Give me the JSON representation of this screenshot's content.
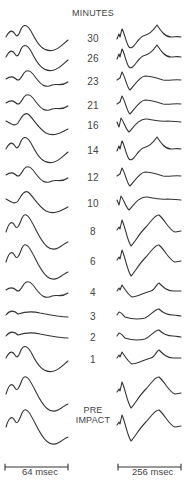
{
  "figure": {
    "header": "MINUTES",
    "pre_impact_label": [
      "PRE",
      "IMPACT"
    ],
    "rows": [
      {
        "label": "30",
        "y": 37,
        "left": "A",
        "right": "A"
      },
      {
        "label": "26",
        "y": 57,
        "left": "A",
        "right": "A"
      },
      {
        "label": "23",
        "y": 80,
        "left": "B",
        "right": "B"
      },
      {
        "label": "21",
        "y": 104,
        "left": "B",
        "right": "B"
      },
      {
        "label": "16",
        "y": 124,
        "left": "C",
        "right": "C"
      },
      {
        "label": "14",
        "y": 149,
        "left": "A",
        "right": "A"
      },
      {
        "label": "12",
        "y": 176,
        "left": "B",
        "right": "B"
      },
      {
        "label": "10",
        "y": 202,
        "left": "C",
        "right": "C"
      },
      {
        "label": "8",
        "y": 230,
        "left": "D",
        "right": "D"
      },
      {
        "label": "6",
        "y": 260,
        "left": "D",
        "right": "D"
      },
      {
        "label": "4",
        "y": 291,
        "left": "B",
        "right": "E"
      },
      {
        "label": "3",
        "y": 315,
        "left": "F",
        "right": "F"
      },
      {
        "label": "2",
        "y": 336,
        "left": "F",
        "right": "F"
      },
      {
        "label": "1",
        "y": 358,
        "left": "A",
        "right": "E"
      },
      {
        "label": "",
        "y": 392,
        "left": "D",
        "right": "D"
      },
      {
        "label": "",
        "y": 425,
        "left": "D",
        "right": "D"
      }
    ],
    "scale_bars": [
      {
        "label": "64 msec",
        "x1": 5,
        "x2": 68,
        "y": 467
      },
      {
        "label": "256 msec",
        "x1": 118,
        "x2": 181,
        "y": 467
      }
    ]
  }
}
